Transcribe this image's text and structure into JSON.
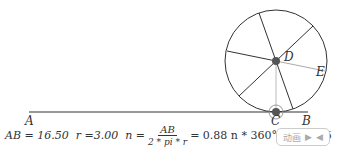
{
  "points": {
    "A": "A",
    "B": "B",
    "C": "C",
    "D": "D",
    "E": "E"
  },
  "formula": {
    "ab": "AB = 16.50",
    "r": "r =3.00",
    "n_eq": "n =",
    "frac_num": "AB",
    "frac_den": "2 * pi * r",
    "n_val": "= 0.88",
    "deg": "n * 360° = 315.15"
  },
  "controls": {
    "animate_label": "动画",
    "play_icon": "▶",
    "reverse_icon": "◀"
  },
  "colors": {
    "line": "#333333",
    "point": "#555555"
  }
}
